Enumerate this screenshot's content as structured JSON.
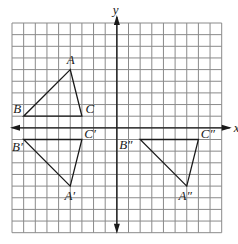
{
  "figure": {
    "grid": {
      "xmin": -9,
      "xmax": 9,
      "ymin": -9,
      "ymax": 9,
      "step": 1
    },
    "axes": {
      "x_label": "x",
      "y_label": "y"
    },
    "colors": {
      "grid": "#8a8a8a",
      "axis": "#1a1a1a",
      "shape": "#1a1a1a"
    },
    "triangles": [
      {
        "name": "ABC",
        "vertices": [
          {
            "label": "A",
            "x": -4,
            "y": 5,
            "lx": -4.3,
            "ly": 5.5
          },
          {
            "label": "B",
            "x": -8,
            "y": 1,
            "lx": -8.9,
            "ly": 1.3
          },
          {
            "label": "C",
            "x": -3,
            "y": 1,
            "lx": -2.7,
            "ly": 1.3
          }
        ]
      },
      {
        "name": "A'B'C'",
        "vertices": [
          {
            "label": "A′",
            "x": -4,
            "y": -5,
            "lx": -4.5,
            "ly": -6.2
          },
          {
            "label": "B′",
            "x": -8,
            "y": -1,
            "lx": -9.0,
            "ly": -2.0
          },
          {
            "label": "C′",
            "x": -3,
            "y": -1,
            "lx": -2.8,
            "ly": -0.9
          }
        ]
      },
      {
        "name": "A''B''C''",
        "vertices": [
          {
            "label": "A″",
            "x": 6,
            "y": -5,
            "lx": 5.3,
            "ly": -6.2
          },
          {
            "label": "B″",
            "x": 2,
            "y": -1,
            "lx": 0.2,
            "ly": -1.8
          },
          {
            "label": "C″",
            "x": 7,
            "y": -1,
            "lx": 7.2,
            "ly": -0.9
          }
        ]
      }
    ]
  }
}
